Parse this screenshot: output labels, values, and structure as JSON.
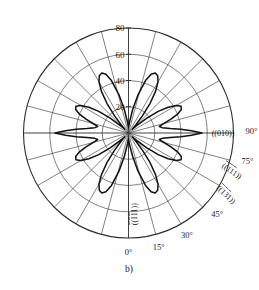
{
  "figure": {
    "caption": "b)",
    "type": "polar-anisotropy-diagram"
  },
  "chart_data": {
    "type": "line",
    "title": "",
    "subtitle": "",
    "plot_kind": "polar",
    "xlabel": "",
    "ylabel": "",
    "grid": true,
    "legend_position": "none",
    "radial_axis": {
      "label": "",
      "ticks": [
        20,
        40,
        60,
        80
      ],
      "tick_labels": [
        "20",
        "40",
        "60",
        "80"
      ],
      "rlim": [
        0,
        80
      ],
      "tick_label_angle_deg": 90
    },
    "angular_axis": {
      "label": "",
      "unit": "degrees",
      "ticks": [
        0,
        15,
        30,
        45,
        60,
        75,
        90
      ],
      "tick_labels": [
        "0°",
        "15°",
        "30°",
        "45°",
        "60°",
        "75°",
        "90°"
      ],
      "visible_tick_labels": [
        "0°",
        "15°",
        "30°",
        "45°",
        "75°",
        "90°"
      ],
      "spoke_step_deg": 15,
      "zero_position": "bottom",
      "direction": "counterclockwise-from-bottom"
    },
    "annotations": [
      {
        "text": "(010)",
        "angle_deg": 90,
        "radius": 72,
        "name": "miller-010"
      },
      {
        "text": "(111)",
        "angle_deg": 70,
        "radius": 84,
        "name": "miller-111-upper",
        "overbars": [
          0,
          1,
          2
        ]
      },
      {
        "text": "(131)",
        "angle_deg": 58,
        "radius": 88,
        "name": "miller-131",
        "overbars": [
          0,
          1,
          2
        ]
      },
      {
        "text": "(111)",
        "angle_deg": 4,
        "radius": 62,
        "name": "miller-111-lower",
        "overbars": [
          0,
          1,
          2
        ]
      }
    ],
    "series": [
      {
        "name": "etch rate",
        "closed": true,
        "units": "arbitrary",
        "theta_deg": [
          0,
          5,
          10,
          14,
          18,
          21,
          24,
          27,
          30,
          33,
          36,
          39,
          42,
          45,
          48,
          51,
          54,
          57,
          60,
          63,
          66,
          69,
          72,
          75,
          78,
          81,
          84,
          86,
          88,
          90,
          92,
          94,
          96,
          99,
          102,
          105,
          108,
          111,
          114,
          117,
          120,
          123,
          126,
          129,
          132,
          135,
          138,
          141,
          144,
          147,
          150,
          153,
          156,
          159,
          162,
          166,
          170,
          175,
          180,
          185,
          190,
          194,
          198,
          201,
          204,
          207,
          210,
          213,
          216,
          219,
          222,
          225,
          228,
          231,
          234,
          237,
          240,
          243,
          246,
          249,
          252,
          255,
          258,
          261,
          264,
          266,
          268,
          270,
          272,
          274,
          276,
          279,
          282,
          285,
          288,
          291,
          294,
          297,
          300,
          303,
          306,
          309,
          312,
          315,
          318,
          321,
          324,
          327,
          330,
          333,
          336,
          339,
          342,
          346,
          350,
          355
        ],
        "r": [
          4,
          9,
          18,
          30,
          42,
          48,
          50,
          49,
          45,
          38,
          28,
          17,
          8,
          4,
          9,
          18,
          28,
          36,
          42,
          45,
          44,
          40,
          34,
          28,
          24,
          26,
          32,
          40,
          48,
          56,
          48,
          40,
          32,
          26,
          24,
          28,
          34,
          40,
          44,
          45,
          42,
          36,
          28,
          18,
          9,
          4,
          8,
          17,
          28,
          38,
          45,
          49,
          50,
          48,
          42,
          30,
          18,
          8,
          4,
          8,
          18,
          30,
          42,
          48,
          50,
          49,
          45,
          38,
          28,
          17,
          8,
          4,
          9,
          18,
          28,
          36,
          42,
          45,
          44,
          40,
          34,
          28,
          24,
          26,
          32,
          40,
          48,
          56,
          48,
          40,
          32,
          26,
          24,
          28,
          34,
          40,
          44,
          45,
          42,
          36,
          28,
          18,
          9,
          4,
          8,
          17,
          28,
          38,
          45,
          49,
          50,
          48,
          42,
          30,
          18,
          8,
          4
        ]
      }
    ]
  }
}
